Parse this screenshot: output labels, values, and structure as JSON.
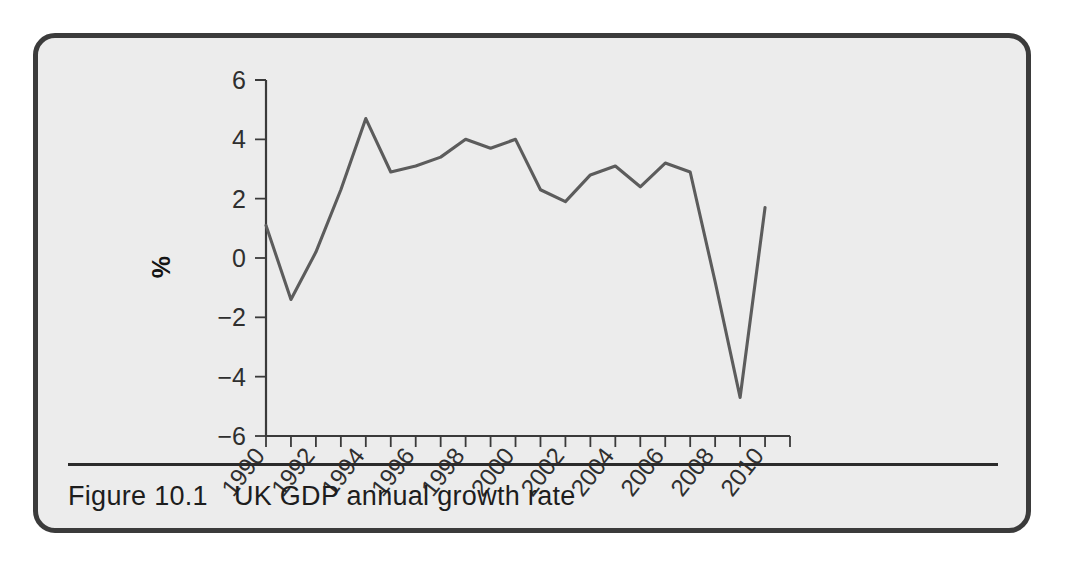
{
  "figure": {
    "caption_label": "Figure 10.1",
    "caption_text": "UK GDP annual growth rate",
    "border_color": "#3b3b3b",
    "background_color": "#ececec",
    "line_color": "#5c5c5c"
  },
  "chart_data": {
    "type": "line",
    "title": "UK GDP annual growth rate",
    "xlabel": "",
    "ylabel": "%",
    "ylim": [
      -6,
      6
    ],
    "xlim": [
      1990,
      2011
    ],
    "grid": false,
    "legend": "none",
    "y_ticks": [
      "6",
      "4",
      "2",
      "0",
      "−2",
      "−4",
      "−6"
    ],
    "y_tick_values": [
      6,
      4,
      2,
      0,
      -2,
      -4,
      -6
    ],
    "x_tick_labels": [
      "1990",
      "1992",
      "1994",
      "1996",
      "1998",
      "2000",
      "2002",
      "2004",
      "2006",
      "2008",
      "2010"
    ],
    "x_tick_values": [
      1990,
      1992,
      1994,
      1996,
      1998,
      2000,
      2002,
      2004,
      2006,
      2008,
      2010
    ],
    "x_minor_tick_values": [
      1991,
      1993,
      1995,
      1997,
      1999,
      2001,
      2003,
      2005,
      2007,
      2009,
      2011
    ],
    "categories": [
      1990,
      1991,
      1992,
      1993,
      1994,
      1995,
      1996,
      1997,
      1998,
      1999,
      2000,
      2001,
      2002,
      2003,
      2004,
      2005,
      2006,
      2007,
      2008,
      2009,
      2010
    ],
    "values": [
      1.1,
      -1.4,
      0.2,
      2.3,
      4.7,
      2.9,
      3.1,
      3.4,
      4.0,
      3.7,
      4.0,
      2.3,
      1.9,
      2.8,
      3.1,
      2.4,
      3.2,
      2.9,
      -0.8,
      -4.7,
      1.7
    ],
    "series": [
      {
        "name": "UK GDP annual growth rate",
        "values": [
          1.1,
          -1.4,
          0.2,
          2.3,
          4.7,
          2.9,
          3.1,
          3.4,
          4.0,
          3.7,
          4.0,
          2.3,
          1.9,
          2.8,
          3.1,
          2.4,
          3.2,
          2.9,
          -0.8,
          -4.7,
          1.7
        ]
      }
    ]
  }
}
